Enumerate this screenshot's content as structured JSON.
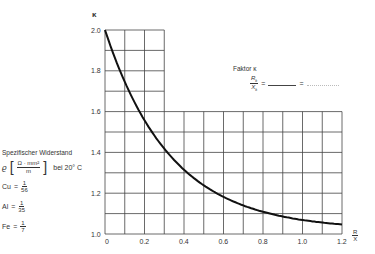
{
  "chart_data": {
    "type": "line",
    "title": "",
    "xlabel": "R/X",
    "xlabel_num": "R",
    "xlabel_den": "X",
    "ylabel": "κ",
    "xlim": [
      0,
      1.2
    ],
    "ylim": [
      1.0,
      2.0
    ],
    "grid": true,
    "x_ticks": [
      "0",
      "0.2",
      "0.4",
      "0.6",
      "0.8",
      "1.0",
      "1.2"
    ],
    "y_ticks": [
      "1.0",
      "1.2",
      "1.4",
      "1.6",
      "1.8",
      "2.0"
    ],
    "series": [
      {
        "name": "Faktor κ",
        "x": [
          0,
          0.05,
          0.1,
          0.15,
          0.2,
          0.25,
          0.3,
          0.4,
          0.5,
          0.6,
          0.7,
          0.8,
          0.9,
          1.0,
          1.1,
          1.2
        ],
        "values": [
          2.0,
          1.86,
          1.75,
          1.64,
          1.56,
          1.48,
          1.42,
          1.31,
          1.24,
          1.17,
          1.14,
          1.11,
          1.09,
          1.07,
          1.06,
          1.05
        ]
      }
    ],
    "annotations": {
      "faktor_label": "Faktor κ",
      "ratio_num": "R",
      "ratio_num_sub": "k",
      "ratio_den": "X",
      "ratio_den_sub": "k",
      "equals": "=",
      "resistance_title": "Spezifischer Widerstand",
      "rho_symbol": "ϱ",
      "unit_num": "Ω · mm²",
      "unit_den": "m",
      "temp_text": "bei 20° C",
      "materials": [
        {
          "name": "Cu",
          "num": "1",
          "den": "56"
        },
        {
          "name": "Al",
          "num": "1",
          "den": "35"
        },
        {
          "name": "Fe",
          "num": "1",
          "den": "7"
        }
      ]
    }
  }
}
